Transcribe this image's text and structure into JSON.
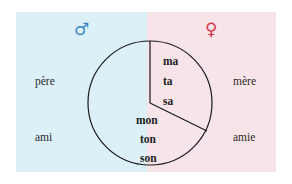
{
  "male_side": {
    "symbol": "♂",
    "symbol_color": "#3a86c4",
    "background": "#dbf0f7",
    "words": [
      "père",
      "ami"
    ]
  },
  "female_side": {
    "symbol": "♀",
    "symbol_color": "#d6364d",
    "background": "#f7e4e8",
    "words": [
      "mère",
      "amie"
    ]
  },
  "circle": {
    "feminine_possessives": [
      "ma",
      "ta",
      "sa"
    ],
    "masculine_possessives": [
      "mon",
      "ton",
      "son"
    ]
  }
}
